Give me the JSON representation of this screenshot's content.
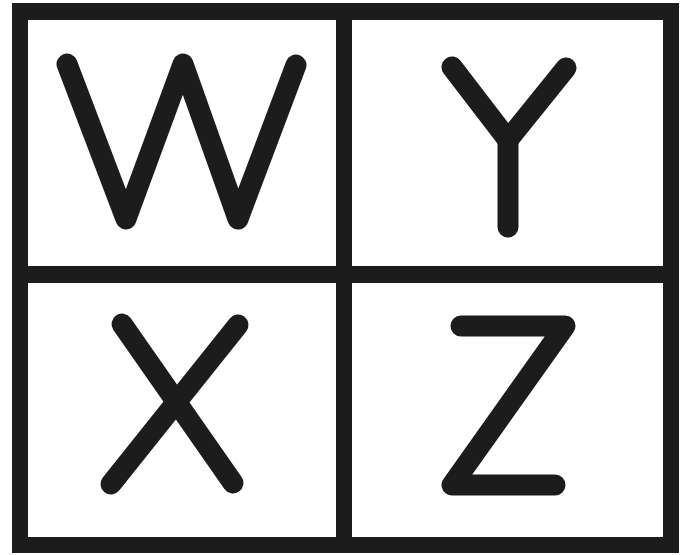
{
  "colors": {
    "ink": "#1c1c1c",
    "background": "#ffffff"
  },
  "grid": {
    "rows": 2,
    "cols": 2,
    "cells": [
      {
        "position": "top-left",
        "letter": "W"
      },
      {
        "position": "top-right",
        "letter": "Y"
      },
      {
        "position": "bottom-left",
        "letter": "X"
      },
      {
        "position": "bottom-right",
        "letter": "Z"
      }
    ]
  }
}
